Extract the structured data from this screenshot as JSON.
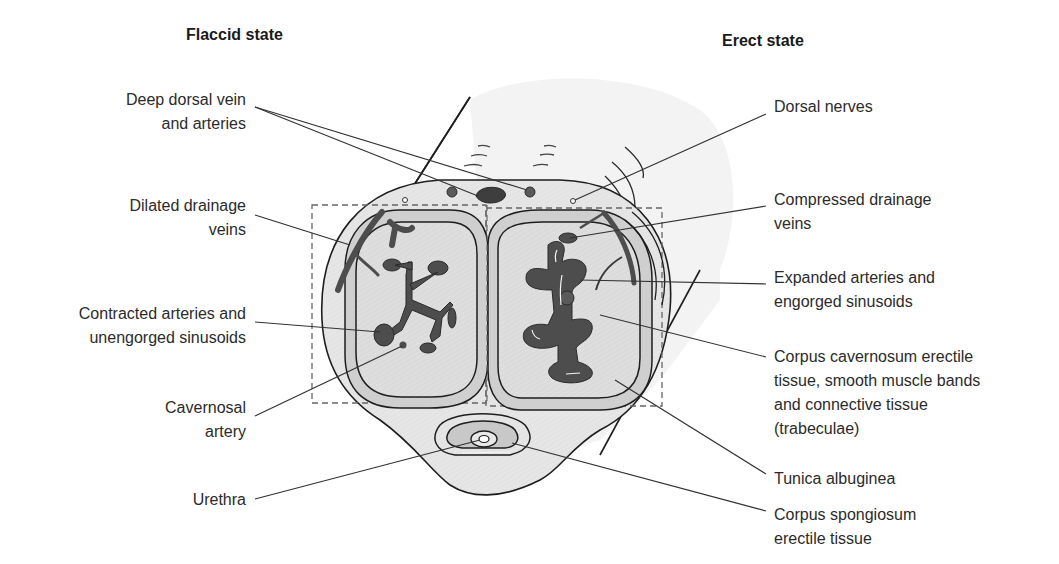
{
  "titles": {
    "flaccid": "Flaccid state",
    "erect": "Erect state"
  },
  "colors": {
    "background": "#ffffff",
    "outer_tissue": "#ececec",
    "tunica_band": "#cfcfcf",
    "erectile_tissue": "#e2e2e2",
    "vessels": "#4d4d4d",
    "outline": "#1e1e1e",
    "leader_lines": "#333333",
    "dashed_box": "#666666"
  },
  "labels_left": [
    {
      "id": "deep-dorsal-vein",
      "lines": [
        "Deep dorsal vein",
        "and arteries"
      ]
    },
    {
      "id": "dilated-drainage-veins",
      "lines": [
        "Dilated drainage",
        "veins"
      ]
    },
    {
      "id": "contracted-arteries",
      "lines": [
        "Contracted arteries and",
        "unengorged sinusoids"
      ]
    },
    {
      "id": "cavernosal-artery",
      "lines": [
        "Cavernosal",
        "artery"
      ]
    },
    {
      "id": "urethra",
      "lines": [
        "Urethra"
      ]
    }
  ],
  "labels_right": [
    {
      "id": "dorsal-nerves",
      "lines": [
        "Dorsal nerves"
      ]
    },
    {
      "id": "compressed-drainage-veins",
      "lines": [
        "Compressed drainage",
        "veins"
      ]
    },
    {
      "id": "expanded-arteries",
      "lines": [
        "Expanded arteries and",
        "engorged sinusoids"
      ]
    },
    {
      "id": "corpus-cavernosum",
      "lines": [
        "Corpus cavernosum erectile",
        "tissue, smooth muscle bands",
        "and connective tissue",
        "(trabeculae)"
      ]
    },
    {
      "id": "tunica-albuginea",
      "lines": [
        "Tunica albuginea"
      ]
    },
    {
      "id": "corpus-spongiosum",
      "lines": [
        "Corpus spongiosum",
        "erectile tissue"
      ]
    }
  ]
}
